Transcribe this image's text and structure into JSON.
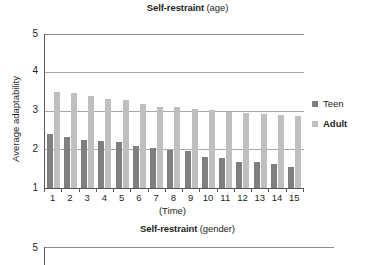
{
  "charts": [
    {
      "title_main": "Self-restraint",
      "title_sub": " (age)",
      "ylabel": "Average adaptability",
      "xlabel": "(Time)"
    },
    {
      "title_main": "Self-restraint",
      "title_sub": " (gender)"
    }
  ],
  "legend": {
    "teen_label": "Teen",
    "adult_label": "Adult",
    "teen_color": "#7f7f7f",
    "adult_color": "#bfbfbf"
  },
  "yticks": [
    "5",
    "4",
    "3",
    "2",
    "1"
  ],
  "yticks2": [
    "5"
  ],
  "xticks": [
    "1",
    "2",
    "3",
    "4",
    "5",
    "6",
    "7",
    "8",
    "9",
    "10",
    "11",
    "12",
    "13",
    "14",
    "15"
  ],
  "chart_data": {
    "type": "bar",
    "title": "Self-restraint (age)",
    "xlabel": "(Time)",
    "ylabel": "Average adaptability",
    "ylim": [
      1,
      5
    ],
    "yticks": [
      1,
      2,
      3,
      4,
      5
    ],
    "grid": true,
    "legend_position": "right",
    "categories": [
      "1",
      "2",
      "3",
      "4",
      "5",
      "6",
      "7",
      "8",
      "9",
      "10",
      "11",
      "12",
      "13",
      "14",
      "15"
    ],
    "series": [
      {
        "name": "Teen",
        "color": "#7f7f7f",
        "values": [
          2.4,
          2.33,
          2.25,
          2.22,
          2.2,
          2.08,
          2.05,
          1.98,
          1.95,
          1.8,
          1.78,
          1.68,
          1.68,
          1.62,
          1.55
        ]
      },
      {
        "name": "Adult",
        "color": "#bfbfbf",
        "values": [
          3.5,
          3.48,
          3.4,
          3.32,
          3.28,
          3.18,
          3.1,
          3.1,
          3.05,
          3.02,
          2.98,
          2.95,
          2.92,
          2.9,
          2.88
        ]
      }
    ]
  },
  "chart_data_2": {
    "type": "bar",
    "title": "Self-restraint (gender)",
    "ylim": [
      1,
      5
    ],
    "yticks": [
      5
    ],
    "note": "chart cropped at bottom edge of screenshot"
  }
}
